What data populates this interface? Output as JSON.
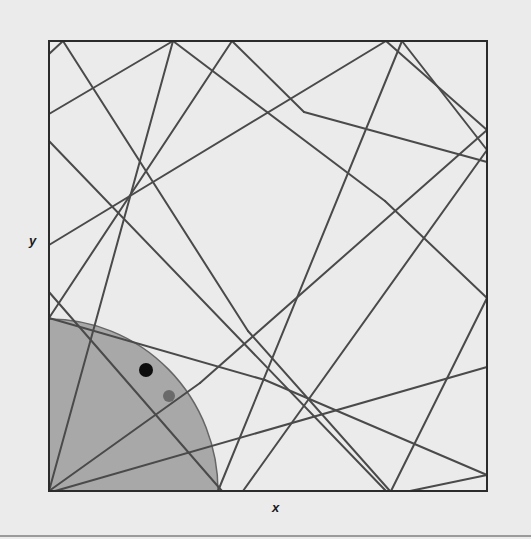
{
  "figure": {
    "type": "billiard-trajectory-diagram",
    "axes": {
      "xlabel": "x",
      "ylabel": "y"
    },
    "colors": {
      "background": "#ebebeb",
      "frame": "#2b2b2b",
      "line": "#4a4a4a",
      "quarter_circle_fill": "#a8a8a8",
      "quarter_circle_stroke": "#666666",
      "point_primary": "#0d0d0d",
      "point_secondary": "#6a6a6a"
    },
    "frame": {
      "x0": 49,
      "y0": 41,
      "x1": 487,
      "y1": 491
    },
    "quarter_circle": {
      "cx": 49,
      "cy": 491,
      "rx": 169,
      "ry": 172
    },
    "points": [
      {
        "name": "primary-point",
        "x": 146,
        "y": 370,
        "r": 7
      },
      {
        "name": "secondary-point",
        "x": 169,
        "y": 396,
        "r": 6
      }
    ],
    "segments": [
      [
        [
          49,
          491
        ],
        [
          173,
          41
        ]
      ],
      [
        [
          49,
          491
        ],
        [
          200,
          383
        ]
      ],
      [
        [
          49,
          54
        ],
        [
          63,
          41
        ]
      ],
      [
        [
          63,
          41
        ],
        [
          248,
          331
        ]
      ],
      [
        [
          248,
          331
        ],
        [
          390,
          491
        ]
      ],
      [
        [
          49,
          114
        ],
        [
          173,
          41
        ]
      ],
      [
        [
          173,
          41
        ],
        [
          385,
          201
        ]
      ],
      [
        [
          385,
          201
        ],
        [
          487,
          298
        ]
      ],
      [
        [
          232,
          41
        ],
        [
          49,
          318
        ]
      ],
      [
        [
          232,
          41
        ],
        [
          304,
          112
        ]
      ],
      [
        [
          49,
          141
        ],
        [
          386,
          491
        ]
      ],
      [
        [
          49,
          245
        ],
        [
          386,
          41
        ]
      ],
      [
        [
          386,
          41
        ],
        [
          487,
          130
        ]
      ],
      [
        [
          402,
          41
        ],
        [
          218,
          491
        ]
      ],
      [
        [
          402,
          41
        ],
        [
          487,
          150
        ]
      ],
      [
        [
          487,
          130
        ],
        [
          200,
          383
        ]
      ],
      [
        [
          487,
          150
        ],
        [
          243,
          491
        ]
      ],
      [
        [
          487,
          162
        ],
        [
          304,
          112
        ]
      ],
      [
        [
          49,
          292
        ],
        [
          222,
          491
        ]
      ],
      [
        [
          487,
          298
        ],
        [
          391,
          491
        ]
      ],
      [
        [
          487,
          367
        ],
        [
          55,
          491
        ]
      ],
      [
        [
          410,
          491
        ],
        [
          487,
          475
        ]
      ],
      [
        [
          265,
          380
        ],
        [
          487,
          475
        ]
      ],
      [
        [
          49,
          318
        ],
        [
          265,
          380
        ]
      ]
    ]
  }
}
